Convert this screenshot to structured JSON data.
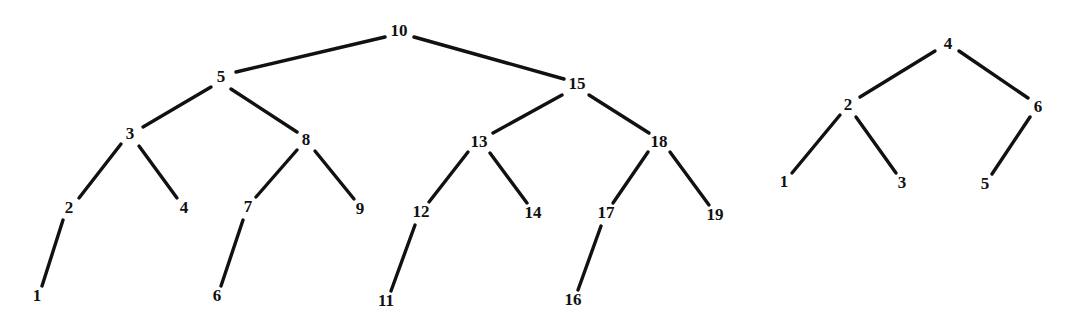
{
  "figure": {
    "title": "",
    "background_color": "#ffffff",
    "ink_color": "#111111",
    "width": 1066,
    "height": 329
  },
  "chart_data": {
    "type": "diagram",
    "diagram_kind": "binary-tree",
    "title": "",
    "xlabel": "",
    "ylabel": "",
    "grid": false,
    "legend": "none",
    "trees": [
      {
        "name": "left-tree",
        "root": "10",
        "node_count": 19,
        "nodes": [
          {
            "id": "10",
            "label": "10",
            "x": 399,
            "y": 32
          },
          {
            "id": "5",
            "label": "5",
            "x": 221,
            "y": 78
          },
          {
            "id": "15",
            "label": "15",
            "x": 577,
            "y": 85
          },
          {
            "id": "3",
            "label": "3",
            "x": 130,
            "y": 135
          },
          {
            "id": "8",
            "label": "8",
            "x": 306,
            "y": 141
          },
          {
            "id": "13",
            "label": "13",
            "x": 479,
            "y": 143
          },
          {
            "id": "18",
            "label": "18",
            "x": 659,
            "y": 143
          },
          {
            "id": "2",
            "label": "2",
            "x": 69,
            "y": 209
          },
          {
            "id": "4",
            "label": "4",
            "x": 184,
            "y": 209
          },
          {
            "id": "7",
            "label": "7",
            "x": 248,
            "y": 208
          },
          {
            "id": "9",
            "label": "9",
            "x": 360,
            "y": 210
          },
          {
            "id": "12",
            "label": "12",
            "x": 421,
            "y": 213
          },
          {
            "id": "14",
            "label": "14",
            "x": 533,
            "y": 214
          },
          {
            "id": "17",
            "label": "17",
            "x": 606,
            "y": 214
          },
          {
            "id": "19",
            "label": "19",
            "x": 715,
            "y": 216
          },
          {
            "id": "1",
            "label": "1",
            "x": 37,
            "y": 297
          },
          {
            "id": "6",
            "label": "6",
            "x": 217,
            "y": 297
          },
          {
            "id": "11",
            "label": "11",
            "x": 386,
            "y": 302
          },
          {
            "id": "16",
            "label": "16",
            "x": 573,
            "y": 301
          }
        ],
        "edges": [
          {
            "from": "10",
            "to": "5",
            "x1": 385,
            "y1": 37,
            "x2": 236,
            "y2": 72
          },
          {
            "from": "10",
            "to": "15",
            "x1": 414,
            "y1": 37,
            "x2": 564,
            "y2": 79
          },
          {
            "from": "5",
            "to": "3",
            "x1": 211,
            "y1": 87,
            "x2": 143,
            "y2": 127
          },
          {
            "from": "5",
            "to": "8",
            "x1": 231,
            "y1": 89,
            "x2": 297,
            "y2": 132
          },
          {
            "from": "15",
            "to": "13",
            "x1": 562,
            "y1": 95,
            "x2": 493,
            "y2": 133
          },
          {
            "from": "15",
            "to": "18",
            "x1": 589,
            "y1": 95,
            "x2": 649,
            "y2": 133
          },
          {
            "from": "3",
            "to": "2",
            "x1": 121,
            "y1": 144,
            "x2": 79,
            "y2": 198
          },
          {
            "from": "3",
            "to": "4",
            "x1": 139,
            "y1": 146,
            "x2": 177,
            "y2": 198
          },
          {
            "from": "8",
            "to": "7",
            "x1": 297,
            "y1": 150,
            "x2": 256,
            "y2": 197
          },
          {
            "from": "8",
            "to": "9",
            "x1": 315,
            "y1": 151,
            "x2": 354,
            "y2": 199
          },
          {
            "from": "13",
            "to": "12",
            "x1": 468,
            "y1": 152,
            "x2": 429,
            "y2": 202
          },
          {
            "from": "13",
            "to": "14",
            "x1": 490,
            "y1": 153,
            "x2": 527,
            "y2": 203
          },
          {
            "from": "18",
            "to": "17",
            "x1": 648,
            "y1": 152,
            "x2": 613,
            "y2": 203
          },
          {
            "from": "18",
            "to": "19",
            "x1": 670,
            "y1": 152,
            "x2": 709,
            "y2": 205
          },
          {
            "from": "2",
            "to": "1",
            "x1": 63,
            "y1": 220,
            "x2": 42,
            "y2": 286
          },
          {
            "from": "7",
            "to": "6",
            "x1": 243,
            "y1": 220,
            "x2": 221,
            "y2": 286
          },
          {
            "from": "12",
            "to": "11",
            "x1": 415,
            "y1": 225,
            "x2": 391,
            "y2": 291
          },
          {
            "from": "17",
            "to": "16",
            "x1": 601,
            "y1": 226,
            "x2": 578,
            "y2": 290
          }
        ]
      },
      {
        "name": "right-tree",
        "root": "4",
        "node_count": 6,
        "nodes": [
          {
            "id": "4",
            "label": "4",
            "x": 948,
            "y": 45
          },
          {
            "id": "2",
            "label": "2",
            "x": 848,
            "y": 106
          },
          {
            "id": "6",
            "label": "6",
            "x": 1038,
            "y": 108
          },
          {
            "id": "1",
            "label": "1",
            "x": 784,
            "y": 183
          },
          {
            "id": "3",
            "label": "3",
            "x": 902,
            "y": 184
          },
          {
            "id": "5",
            "label": "5",
            "x": 985,
            "y": 185
          }
        ],
        "edges": [
          {
            "from": "4",
            "to": "2",
            "x1": 935,
            "y1": 51,
            "x2": 860,
            "y2": 97
          },
          {
            "from": "4",
            "to": "6",
            "x1": 959,
            "y1": 51,
            "x2": 1028,
            "y2": 98
          },
          {
            "from": "2",
            "to": "1",
            "x1": 840,
            "y1": 115,
            "x2": 792,
            "y2": 173
          },
          {
            "from": "2",
            "to": "3",
            "x1": 856,
            "y1": 117,
            "x2": 896,
            "y2": 173
          },
          {
            "from": "6",
            "to": "5",
            "x1": 1030,
            "y1": 117,
            "x2": 992,
            "y2": 174
          }
        ]
      }
    ]
  }
}
